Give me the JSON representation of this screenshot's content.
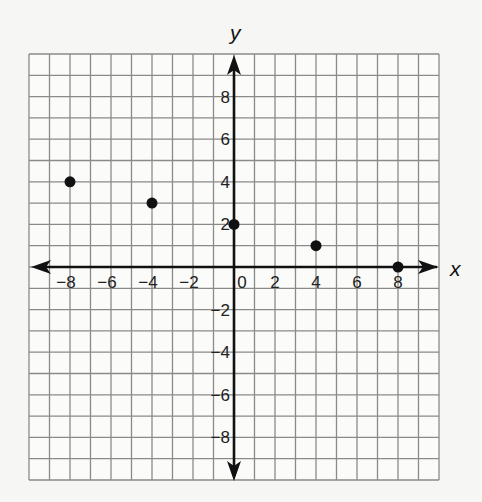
{
  "chart_data": {
    "type": "scatter",
    "title": "",
    "xlabel": "x",
    "ylabel": "y",
    "xlim": [
      -10,
      10
    ],
    "ylim": [
      -10,
      10
    ],
    "grid": true,
    "grid_step": 1,
    "x_ticks": [
      -8,
      -6,
      -4,
      -2,
      0,
      2,
      4,
      6,
      8
    ],
    "y_ticks": [
      8,
      6,
      4,
      2,
      -2,
      -4,
      -6,
      -8
    ],
    "x_tick_labels": [
      "−8",
      "−6",
      "−4",
      "−2",
      "0",
      "2",
      "4",
      "6",
      "8"
    ],
    "y_tick_labels": [
      "8",
      "6",
      "4",
      "2",
      "−2",
      "−4",
      "−6",
      "−8"
    ],
    "series": [
      {
        "name": "points",
        "points": [
          {
            "x": -8,
            "y": 4
          },
          {
            "x": -4,
            "y": 3
          },
          {
            "x": 0,
            "y": 2
          },
          {
            "x": 4,
            "y": 1
          },
          {
            "x": 8,
            "y": 0
          }
        ]
      }
    ],
    "legend": null
  }
}
